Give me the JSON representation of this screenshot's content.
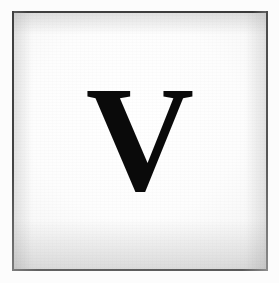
{
  "image": {
    "kind": "scanned-letter-card",
    "subject": "single capital letter on a framed white card",
    "width": 279,
    "height": 283
  },
  "card": {
    "letter": "V",
    "letter_case": "uppercase",
    "letter_style": "serif",
    "letter_weight": "bold",
    "letter_color": "#0a0a0a",
    "background_color": "#fdfdfd",
    "surround_color": "#fcfcfc"
  },
  "frame": {
    "top_color": "#3a3a3a",
    "left_color": "#3f3f3f",
    "right_color": "#555555",
    "bottom_color": "#5a5a5a",
    "inset_left": 12,
    "inset_top": 11,
    "width": 256,
    "height": 260
  },
  "shading": {
    "vignette_center": "#ffffff",
    "vignette_edge": "#c4c4c4",
    "texture": "paper-grain"
  }
}
